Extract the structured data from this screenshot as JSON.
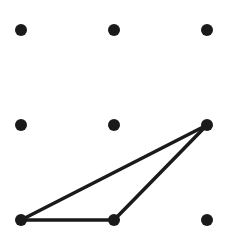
{
  "diagram": {
    "type": "dot-grid-with-polygon",
    "grid": {
      "rows": 3,
      "cols": 3
    },
    "dot_color": "#1a1a1a",
    "line_color": "#1a1a1a",
    "triangle_vertices": [
      {
        "row": 2,
        "col": 0
      },
      {
        "row": 2,
        "col": 1
      },
      {
        "row": 1,
        "col": 2
      }
    ]
  }
}
